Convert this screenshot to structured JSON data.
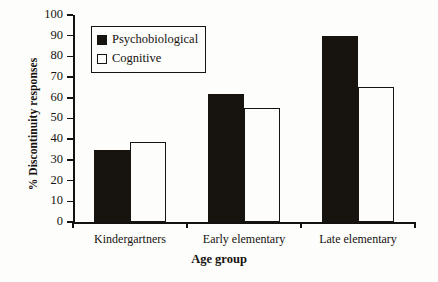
{
  "chart_data": {
    "type": "bar",
    "title": "",
    "xlabel": "Age group",
    "ylabel": "% Discontinuity responses",
    "categories": [
      "Kindergartners",
      "Early elementary",
      "Late elementary"
    ],
    "series": [
      {
        "name": "Psychobiological",
        "values": [
          35,
          62,
          90
        ],
        "style": "filled",
        "color": "#17140f"
      },
      {
        "name": "Cognitive",
        "values": [
          38.5,
          55,
          65
        ],
        "style": "open",
        "color": "#ffffff"
      }
    ],
    "ylim": [
      0,
      100
    ],
    "ytick_labels": [
      "100",
      "90",
      "80",
      "70",
      "60",
      "50",
      "40",
      "30",
      "20",
      "10",
      "0"
    ],
    "ytick_values": [
      100,
      90,
      80,
      70,
      60,
      50,
      40,
      30,
      20,
      10,
      0
    ],
    "grid": false,
    "legend_position": "top-left"
  },
  "legend": {
    "items": [
      {
        "label": "Psychobiological",
        "swatch": "filled-square-icon"
      },
      {
        "label": "Cognitive",
        "swatch": "open-square-icon"
      }
    ]
  }
}
